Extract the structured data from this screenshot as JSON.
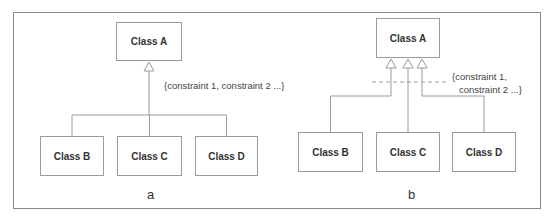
{
  "diagram": {
    "colors": {
      "line": "#9a9a9a",
      "frame": "#8a8a8a",
      "text": "#333333"
    },
    "panels": [
      {
        "id": "a",
        "label": "a",
        "label_pos": {
          "x": 147,
          "y": 187
        },
        "superclass": {
          "name": "Class A",
          "x": 116,
          "y": 22,
          "w": 66,
          "h": 39
        },
        "subclasses": [
          {
            "name": "Class B",
            "x": 40,
            "y": 136,
            "w": 64,
            "h": 40
          },
          {
            "name": "Class C",
            "x": 117,
            "y": 136,
            "w": 65,
            "h": 40
          },
          {
            "name": "Class D",
            "x": 195,
            "y": 136,
            "w": 63,
            "h": 40
          }
        ],
        "style": "shared-target",
        "constraint_lines": [
          "{constraint 1, constraint 2 ...}"
        ],
        "constraint_pos": {
          "x": 164,
          "y": 79
        }
      },
      {
        "id": "b",
        "label": "b",
        "label_pos": {
          "x": 408,
          "y": 187
        },
        "superclass": {
          "name": "Class A",
          "x": 376,
          "y": 18,
          "w": 64,
          "h": 40
        },
        "subclasses": [
          {
            "name": "Class B",
            "x": 298,
            "y": 132,
            "w": 65,
            "h": 40
          },
          {
            "name": "Class C",
            "x": 376,
            "y": 132,
            "w": 64,
            "h": 40
          },
          {
            "name": "Class D",
            "x": 452,
            "y": 132,
            "w": 64,
            "h": 40
          }
        ],
        "style": "separate-targets",
        "constraint_lines": [
          "{constraint 1,",
          "constraint 2 ...}"
        ],
        "constraint_pos": {
          "x": 452,
          "y": 70
        },
        "dashed_line": {
          "x1": 372,
          "x2": 448,
          "y": 82
        }
      }
    ]
  }
}
